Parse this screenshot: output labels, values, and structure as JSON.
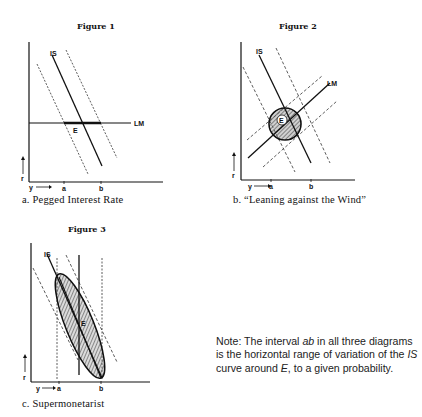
{
  "figures": [
    {
      "title": "Figure 1",
      "caption": "a.  Pegged Interest Rate",
      "labels": {
        "is": "IS",
        "lm": "LM",
        "e": "E",
        "y": "y",
        "r": "r",
        "a": "a",
        "b": "b"
      }
    },
    {
      "title": "Figure 2",
      "caption": "b.  “Leaning against the Wind”",
      "labels": {
        "is": "IS",
        "lm": "LM",
        "e": "E",
        "y": "y",
        "r": "r",
        "a": "a",
        "b": "b"
      }
    },
    {
      "title": "Figure 3",
      "caption": "c.  Supermonetarist",
      "labels": {
        "is": "IS",
        "e": "E",
        "y": "y",
        "r": "r",
        "a": "a",
        "b": "b"
      }
    }
  ],
  "note": {
    "prefix": "Note: The interval ",
    "ab": "ab",
    "middle": " in all three diagrams is the horizontal range of variation of the ",
    "is": "IS",
    "middle2": " curve around ",
    "e": "E",
    "suffix": ", to a given probability."
  }
}
